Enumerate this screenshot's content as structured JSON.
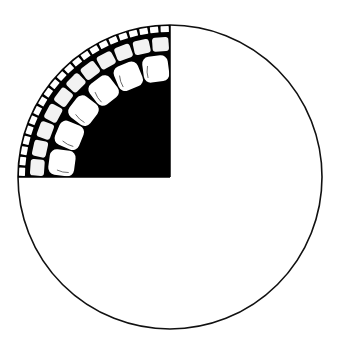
{
  "figure": {
    "type": "quadrant-cutaway-circle",
    "canvas": {
      "width": 341,
      "height": 360,
      "background": "#ffffff"
    },
    "circle": {
      "cx": 170,
      "cy": 177,
      "r": 152,
      "stroke": "#111111",
      "stroke_width": 1.6,
      "fill": "#ffffff"
    },
    "sector": {
      "quadrant": "top-left",
      "fill": "#000000"
    },
    "rings": [
      {
        "name": "outer-small-cells",
        "count": 22,
        "r_inner": 145,
        "r_outer": 151,
        "rx": 0.5,
        "fill": "#ffffff"
      },
      {
        "name": "middle-rounded-cells",
        "count": 11,
        "r_inner": 126,
        "r_outer": 140,
        "rx": 3,
        "fill": "#f2f2f2"
      },
      {
        "name": "inner-large-cells",
        "count": 6,
        "r_inner": 96,
        "r_outer": 122,
        "rx": 7,
        "fill": "#ffffff"
      }
    ]
  }
}
